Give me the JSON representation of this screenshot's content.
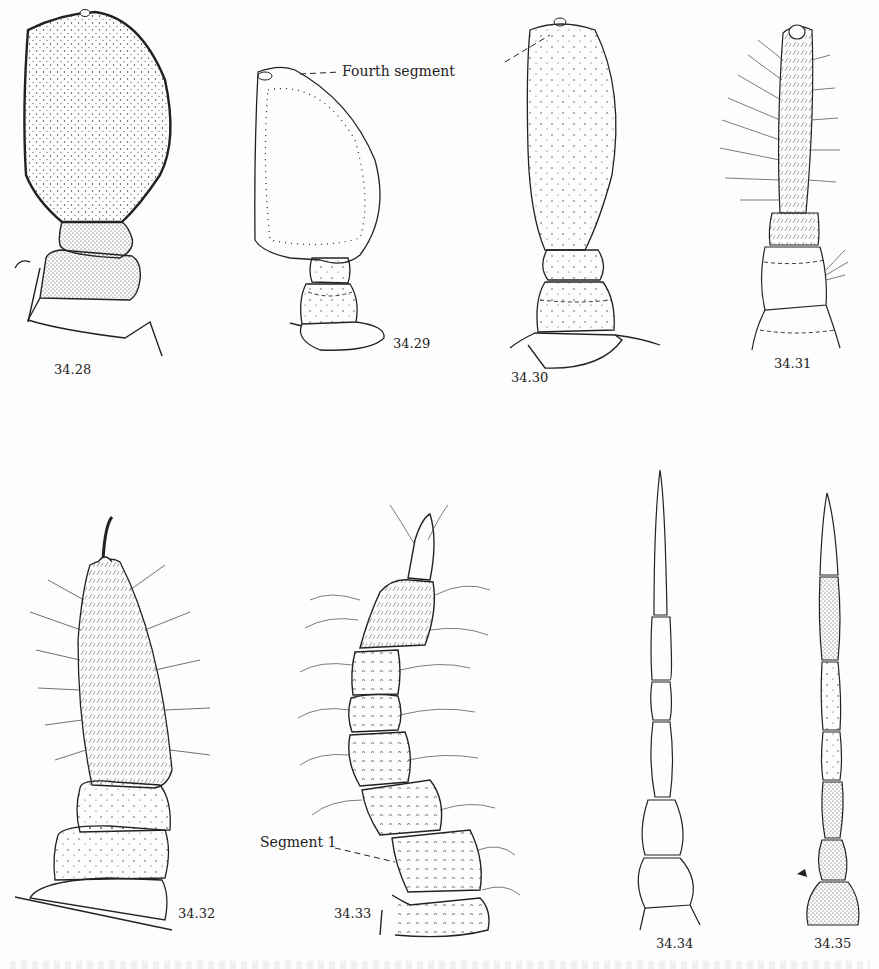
{
  "page": {
    "type": "scientific figure plate"
  },
  "callouts": {
    "fourth_segment": "Fourth segment",
    "segment_1": "Segment 1"
  },
  "figures": [
    {
      "id": "34.28",
      "label": "34.28",
      "description": "clubbed antenna with large stippled fourth segment"
    },
    {
      "id": "34.29",
      "label": "34.29",
      "description": "antenna with rounded fourth segment, dotted inner outline"
    },
    {
      "id": "34.30",
      "label": "34.30",
      "description": "antenna with elongate oval stippled fourth segment"
    },
    {
      "id": "34.31",
      "label": "34.31",
      "description": "antenna with long setose cylindrical terminal segment"
    },
    {
      "id": "34.32",
      "label": "34.32",
      "description": "antenna with densely bristled fusiform terminal segment"
    },
    {
      "id": "34.33",
      "label": "34.33",
      "description": "multi-segmented hairy antenna, Segment 1 indicated"
    },
    {
      "id": "34.34",
      "label": "34.34",
      "description": "slender segmented antenna with tapering tip, unstippled"
    },
    {
      "id": "34.35",
      "label": "34.35",
      "description": "slender segmented antenna with stippled segments"
    }
  ]
}
